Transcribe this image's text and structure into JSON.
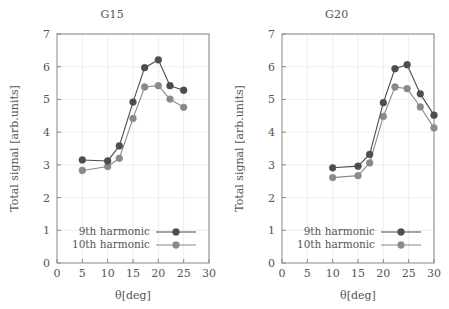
{
  "figure": {
    "background": "#ffffff",
    "text_color": "#555555",
    "frame_color": "#888888",
    "grid_color": "#e8e8e8"
  },
  "series_colors": {
    "ninth": "#4d4d4d",
    "tenth": "#8a8a8a"
  },
  "chart_data": [
    {
      "type": "line",
      "title": "G15",
      "xlabel": "θ[deg]",
      "ylabel": "Total signal [arb.units]",
      "xlim": [
        0,
        30
      ],
      "ylim": [
        0,
        7
      ],
      "xticks": [
        0,
        5,
        10,
        15,
        20,
        25,
        30
      ],
      "yticks": [
        0,
        1,
        2,
        3,
        4,
        5,
        6,
        7
      ],
      "grid": true,
      "legend_position": "lower center",
      "series": [
        {
          "name": "9th harmonic",
          "color": "#4d4d4d",
          "x": [
            5.0,
            10.0,
            12.3,
            15.0,
            17.3,
            20.0,
            22.3,
            25.0
          ],
          "values": [
            3.15,
            3.12,
            3.58,
            4.92,
            5.97,
            6.21,
            5.42,
            5.28
          ]
        },
        {
          "name": "10th harmonic",
          "color": "#8a8a8a",
          "x": [
            5.0,
            10.0,
            12.3,
            15.0,
            17.3,
            20.0,
            22.3,
            25.0
          ],
          "values": [
            2.83,
            2.95,
            3.2,
            4.42,
            5.38,
            5.42,
            5.01,
            4.76
          ]
        }
      ]
    },
    {
      "type": "line",
      "title": "G20",
      "xlabel": "θ[deg]",
      "ylabel": "Total signal [arb.units]",
      "xlim": [
        0,
        30
      ],
      "ylim": [
        0,
        7
      ],
      "xticks": [
        0,
        5,
        10,
        15,
        20,
        25,
        30
      ],
      "yticks": [
        0,
        1,
        2,
        3,
        4,
        5,
        6,
        7
      ],
      "grid": true,
      "legend_position": "lower center",
      "series": [
        {
          "name": "9th harmonic",
          "color": "#4d4d4d",
          "x": [
            10.0,
            15.0,
            17.3,
            20.0,
            22.3,
            24.7,
            27.3,
            30.0
          ],
          "values": [
            2.91,
            2.96,
            3.32,
            4.9,
            5.94,
            6.06,
            5.17,
            4.52
          ]
        },
        {
          "name": "10th harmonic",
          "color": "#8a8a8a",
          "x": [
            10.0,
            15.0,
            17.3,
            20.0,
            22.3,
            24.7,
            27.3,
            30.0
          ],
          "values": [
            2.61,
            2.67,
            3.06,
            4.48,
            5.38,
            5.33,
            4.77,
            4.13
          ]
        }
      ]
    }
  ]
}
